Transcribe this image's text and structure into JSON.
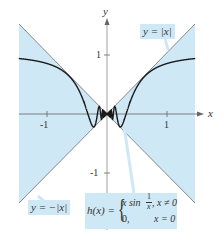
{
  "figure": {
    "axes": {
      "x_label": "x",
      "y_label": "y",
      "x_ticks": [
        "-1",
        "1"
      ],
      "y_ticks": [
        "1",
        "-1"
      ]
    },
    "labels": {
      "upper_bound": "y = |x|",
      "lower_bound": "y = −|x|",
      "function_name": "h(x) =",
      "case1_expr": "x sin",
      "case1_frac_num": "1",
      "case1_frac_den": "x",
      "case1_cond": ", x ≠ 0",
      "case2_expr": "0,",
      "case2_cond": "x = 0"
    },
    "colors": {
      "shade": "#cfe8f5",
      "bound_lines": "#8a8a8a",
      "curve": "#1a1a1a",
      "axis": "#777777"
    }
  },
  "chart_data": {
    "type": "line",
    "title": "",
    "xlabel": "x",
    "ylabel": "y",
    "xlim": [
      -1.47,
      1.47
    ],
    "ylim": [
      -1.5,
      1.5
    ],
    "grid": false,
    "series": [
      {
        "name": "y = |x|",
        "function": "abs(x)"
      },
      {
        "name": "y = -|x|",
        "function": "-abs(x)"
      },
      {
        "name": "h(x) = x sin(1/x), x≠0; 0, x=0",
        "function": "x*sin(1/x)"
      }
    ],
    "annotations": [
      "y = |x|",
      "y = −|x|",
      "h(x) = { x sin(1/x), x ≠ 0 ; 0, x = 0 }"
    ]
  }
}
